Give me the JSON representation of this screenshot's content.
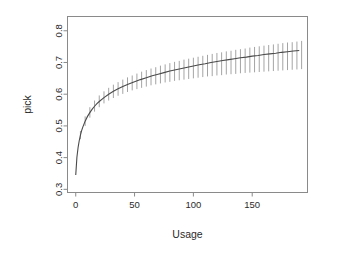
{
  "figure": {
    "background_color": "#ffffff",
    "line_color": "#4a4a4a",
    "errorbar_color": "#9a9a9a",
    "axis_color": "#8a8a8a",
    "text_color": "#2b2b2b"
  },
  "labels": {
    "xlabel": "Usage",
    "ylabel": "pick",
    "ytick_0": "0.3",
    "ytick_1": "0.4",
    "ytick_2": "0.5",
    "ytick_3": "0.6",
    "ytick_4": "0.7",
    "ytick_5": "0.8",
    "xtick_0": "0",
    "xtick_1": "50",
    "xtick_2": "100",
    "xtick_3": "150"
  },
  "chart_data": {
    "type": "line",
    "title": "",
    "subtitle": "",
    "xlabel": "Usage",
    "ylabel": "pick",
    "xlim": [
      -7,
      197
    ],
    "ylim": [
      0.29,
      0.845
    ],
    "xticks": [
      0,
      50,
      100,
      150
    ],
    "xticklabels": [
      "0",
      "50",
      "100",
      "150"
    ],
    "yticks": [
      0.3,
      0.4,
      0.5,
      0.6,
      0.7,
      0.8
    ],
    "yticklabels": [
      "0.3",
      "0.4",
      "0.5",
      "0.6",
      "0.7",
      "0.8"
    ],
    "grid": false,
    "legend": null,
    "legend_position": "none",
    "annotations": [],
    "series": [
      {
        "name": "fitted mean",
        "style": "solid-line",
        "color": "#4a4a4a",
        "x": [
          0,
          1,
          2,
          3,
          4,
          5,
          6,
          8,
          10,
          12,
          14,
          16,
          18,
          20,
          24,
          28,
          32,
          36,
          40,
          45,
          50,
          55,
          60,
          65,
          70,
          75,
          80,
          85,
          90,
          95,
          100,
          105,
          110,
          115,
          120,
          125,
          130,
          135,
          140,
          145,
          150,
          155,
          160,
          165,
          170,
          175,
          180,
          185,
          190
        ],
        "y": [
          0.345,
          0.401,
          0.432,
          0.454,
          0.471,
          0.485,
          0.496,
          0.515,
          0.53,
          0.542,
          0.553,
          0.562,
          0.57,
          0.577,
          0.589,
          0.6,
          0.609,
          0.617,
          0.624,
          0.632,
          0.639,
          0.646,
          0.652,
          0.658,
          0.663,
          0.668,
          0.673,
          0.677,
          0.681,
          0.685,
          0.689,
          0.693,
          0.696,
          0.7,
          0.703,
          0.706,
          0.709,
          0.712,
          0.715,
          0.717,
          0.72,
          0.722,
          0.725,
          0.727,
          0.729,
          0.732,
          0.734,
          0.736,
          0.738
        ]
      }
    ],
    "errorbars": {
      "name": "confidence interval",
      "style": "vertical-lines-no-caps",
      "color": "#9a9a9a",
      "x": [
        4,
        8,
        12,
        16,
        20,
        24,
        28,
        32,
        36,
        40,
        44,
        48,
        52,
        56,
        60,
        64,
        68,
        72,
        76,
        80,
        84,
        88,
        92,
        96,
        100,
        104,
        108,
        112,
        116,
        120,
        124,
        128,
        132,
        136,
        140,
        144,
        148,
        152,
        156,
        160,
        164,
        168,
        172,
        176,
        180,
        184,
        188,
        192
      ],
      "lower": [
        0.458,
        0.5,
        0.526,
        0.545,
        0.559,
        0.571,
        0.58,
        0.588,
        0.595,
        0.601,
        0.607,
        0.612,
        0.616,
        0.62,
        0.624,
        0.628,
        0.631,
        0.634,
        0.637,
        0.639,
        0.642,
        0.644,
        0.646,
        0.648,
        0.65,
        0.652,
        0.654,
        0.656,
        0.657,
        0.659,
        0.66,
        0.662,
        0.663,
        0.664,
        0.666,
        0.667,
        0.668,
        0.669,
        0.67,
        0.671,
        0.672,
        0.673,
        0.674,
        0.675,
        0.676,
        0.677,
        0.678,
        0.679
      ],
      "upper": [
        0.484,
        0.53,
        0.559,
        0.58,
        0.596,
        0.609,
        0.62,
        0.63,
        0.638,
        0.646,
        0.653,
        0.659,
        0.665,
        0.671,
        0.676,
        0.681,
        0.685,
        0.69,
        0.694,
        0.698,
        0.702,
        0.705,
        0.709,
        0.712,
        0.715,
        0.718,
        0.721,
        0.724,
        0.727,
        0.73,
        0.732,
        0.735,
        0.737,
        0.74,
        0.742,
        0.744,
        0.747,
        0.749,
        0.751,
        0.753,
        0.755,
        0.757,
        0.759,
        0.761,
        0.763,
        0.764,
        0.766,
        0.768
      ]
    }
  }
}
